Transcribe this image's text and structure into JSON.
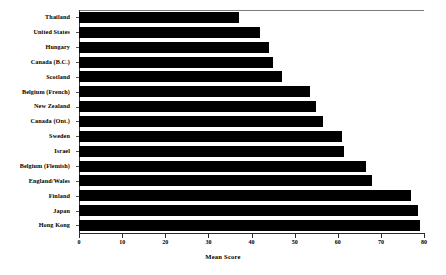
{
  "chart_data": {
    "type": "bar",
    "orientation": "horizontal",
    "title": "",
    "xlabel": "Mean Score",
    "ylabel": "",
    "xlim": [
      0,
      80
    ],
    "xticks": [
      0,
      10,
      20,
      30,
      40,
      50,
      60,
      70,
      80
    ],
    "xtick_labels": [
      "0",
      "10",
      "20",
      "30",
      "40",
      "50",
      "60",
      "70",
      "80"
    ],
    "grid": false,
    "legend": false,
    "bar_color": "#000000",
    "categories": [
      "Thailand",
      "United States",
      "Hungary",
      "Canada (B.C.)",
      "Scotland",
      "Belgium (French)",
      "New Zealand",
      "Canada (Ont.)",
      "Sweden",
      "Israel",
      "Belgium (Flemish)",
      "England/Wales",
      "Finland",
      "Japan",
      "Hong Kong"
    ],
    "values": [
      37,
      42,
      44,
      45,
      47,
      53.5,
      55,
      56.5,
      61,
      61.5,
      66.5,
      68,
      77,
      78.5,
      79
    ]
  }
}
